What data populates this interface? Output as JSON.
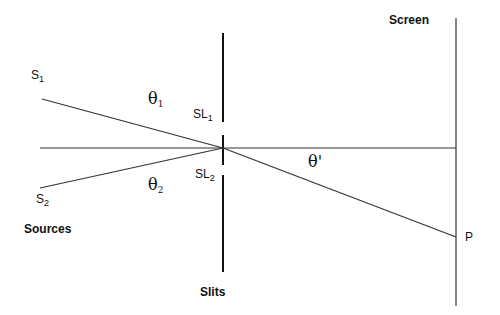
{
  "labels": {
    "s1": {
      "main": "S",
      "sub": "1"
    },
    "s2": {
      "main": "S",
      "sub": "2"
    },
    "sources": "Sources",
    "sl1": {
      "main": "SL",
      "sub": "1"
    },
    "sl2": {
      "main": "SL",
      "sub": "2"
    },
    "theta1": {
      "main": "θ",
      "sub": "1"
    },
    "theta2": {
      "main": "θ",
      "sub": "2"
    },
    "theta_prime": "θ'",
    "slits": "Slits",
    "screen": "Screen",
    "p": "P"
  },
  "colors": {
    "line": "#222222"
  }
}
